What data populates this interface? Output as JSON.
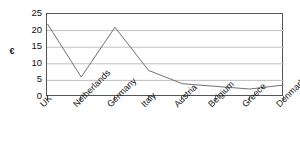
{
  "chart_data": {
    "type": "line",
    "title": "",
    "xlabel": "",
    "ylabel": "€",
    "categories": [
      "UK",
      "Netherlands",
      "Germany",
      "Italy",
      "Austria",
      "Belgium",
      "Greece",
      "Denmark"
    ],
    "values": [
      22,
      6,
      21,
      8,
      4,
      3.2,
      2.4,
      3.6
    ],
    "series": [
      {
        "name": "",
        "values": [
          22,
          6,
          21,
          8,
          4,
          3.2,
          2.4,
          3.6
        ]
      }
    ],
    "ylim": [
      0,
      25
    ],
    "y_ticks": [
      0,
      5,
      10,
      15,
      20,
      25
    ],
    "y_tick_labels": [
      "0",
      "5",
      "10",
      "15",
      "20",
      "25"
    ],
    "grid": true,
    "grid_axis": "y",
    "legend": false,
    "legend_position": "none",
    "markers": false,
    "line_color": "#707070",
    "grid_color": "#bfbfbf",
    "frame_color": "#555555",
    "background": "#ffffff",
    "x_label_rotation": -45
  },
  "axis": {
    "y_title": "€"
  }
}
